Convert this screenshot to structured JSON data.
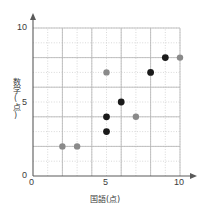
{
  "chart_data": {
    "type": "scatter",
    "title": "",
    "xlabel": "国語(点)",
    "ylabel": "数学(点)",
    "xlim": [
      0,
      10
    ],
    "ylim": [
      0,
      10
    ],
    "xticks": [
      "0",
      "5",
      "10"
    ],
    "yticks": [
      "0",
      "5",
      "10"
    ],
    "grid": true,
    "grid_minor_step": 1,
    "grid_major_step": 2,
    "points": [
      {
        "x": 2,
        "y": 2,
        "color": "#8a8a8a",
        "r": 3.2
      },
      {
        "x": 3,
        "y": 2,
        "color": "#8a8a8a",
        "r": 3.2
      },
      {
        "x": 5,
        "y": 3,
        "color": "#1a1a1a",
        "r": 3.4
      },
      {
        "x": 5,
        "y": 4,
        "color": "#1a1a1a",
        "r": 3.4
      },
      {
        "x": 5,
        "y": 7,
        "color": "#8a8a8a",
        "r": 3.2
      },
      {
        "x": 6,
        "y": 5,
        "color": "#1a1a1a",
        "r": 3.4
      },
      {
        "x": 7,
        "y": 4,
        "color": "#8a8a8a",
        "r": 3.2
      },
      {
        "x": 8,
        "y": 7,
        "color": "#1a1a1a",
        "r": 3.4
      },
      {
        "x": 9,
        "y": 8,
        "color": "#1a1a1a",
        "r": 3.4
      },
      {
        "x": 10,
        "y": 8,
        "color": "#8a8a8a",
        "r": 3.2
      }
    ],
    "colors": {
      "axis": "#5a5a5a",
      "grid_major": "#b4b4b4",
      "grid_minor": "#c8c8c8",
      "dot_dark": "#1a1a1a",
      "dot_light": "#8a8a8a",
      "background": "#ffffff"
    },
    "geometry": {
      "x0_px": 33,
      "y0_px": 176,
      "x10_px": 180,
      "y10_px": 28
    }
  }
}
